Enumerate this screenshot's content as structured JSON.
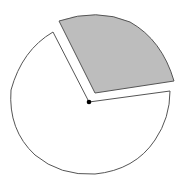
{
  "diagram": {
    "type": "exploded-pie",
    "background": "#ffffff",
    "stroke_color": "#555555",
    "center_dot_color": "#000000",
    "slices": [
      {
        "name": "exploded-slice",
        "fill": "#bdbdbd",
        "path": "M95 93 L59 21 Q97 8 130 22 Q162 40 174 81 Z"
      },
      {
        "name": "main-slice",
        "fill": "#ffffff",
        "path": "M89 102 L53 32 Q22 50 11 90 Q8 130 35 155 Q60 176 95 174 Q135 170 155 140 Q170 118 170 91 Z"
      }
    ],
    "center": {
      "x": 89,
      "y": 102,
      "r": 2.3
    }
  }
}
